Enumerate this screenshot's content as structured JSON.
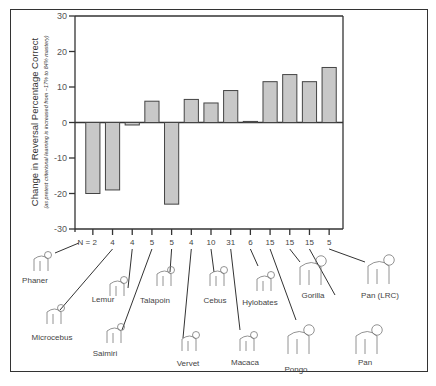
{
  "chart_data": {
    "type": "bar",
    "title": "",
    "ylabel": "Change in Reversal Percentage Correct",
    "ylabel_sub": "(as pretest criterional learning is increased from ~17% to 84% mastery)",
    "xlabel": "",
    "ylim": [
      -30,
      30
    ],
    "yticks": [
      30,
      20,
      10,
      0,
      -10,
      -20,
      -30
    ],
    "grid": false,
    "legend": null,
    "categories": [
      "Phaner",
      "Microcebus",
      "Lemur",
      "Saimiri",
      "Talapoin",
      "Vervet",
      "Cebus",
      "Macaca",
      "Hylobates",
      "Pongo",
      "Gorilla",
      "Pan",
      "Pan (LRC)"
    ],
    "n": [
      2,
      4,
      4,
      5,
      5,
      4,
      10,
      31,
      6,
      15,
      15,
      15,
      5
    ],
    "values": [
      -20,
      -19,
      -0.7,
      6,
      -23,
      6.5,
      5.5,
      9,
      0.3,
      11.5,
      13.5,
      11.5,
      15.5
    ]
  },
  "labels": {
    "n_prefix": "N = ",
    "y_title": "Change in Reversal Percentage Correct",
    "y_subtitle": "(as pretest criterional learning is increased from ~17% to 84% mastery)",
    "species": [
      "Phaner",
      "Microcebus",
      "Lemur",
      "Saimiri",
      "Talapoin",
      "Vervet",
      "Cebus",
      "Macaca",
      "Hylobates",
      "Pongo",
      "Gorilla",
      "Pan",
      "Pan (LRC)"
    ]
  }
}
